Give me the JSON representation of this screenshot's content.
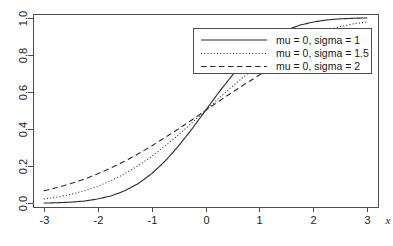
{
  "chart_data": {
    "type": "line",
    "title": "",
    "xlabel": "x",
    "ylabel": "",
    "xlim": [
      -3.2,
      3.2
    ],
    "ylim": [
      -0.02,
      1.02
    ],
    "xticks": [
      "-3",
      "-2",
      "-1",
      "0",
      "1",
      "2",
      "3"
    ],
    "xtick_values": [
      -3,
      -2,
      -1,
      0,
      1,
      2,
      3
    ],
    "yticks": [
      "0.0",
      "0.2",
      "0.4",
      "0.6",
      "0.8",
      "1.0"
    ],
    "ytick_values": [
      0.0,
      0.2,
      0.4,
      0.6,
      0.8,
      1.0
    ],
    "grid": false,
    "legend_position": "top-right",
    "series": [
      {
        "name": "mu = 0, sigma = 1",
        "style": "solid",
        "color": "#2b2b2b",
        "x": [
          -3,
          -2.75,
          -2.5,
          -2.25,
          -2,
          -1.75,
          -1.5,
          -1.25,
          -1,
          -0.75,
          -0.5,
          -0.25,
          0,
          0.25,
          0.5,
          0.75,
          1,
          1.25,
          1.5,
          1.75,
          2,
          2.25,
          2.5,
          2.75,
          3
        ],
        "values": [
          0.001,
          0.003,
          0.006,
          0.012,
          0.023,
          0.04,
          0.067,
          0.106,
          0.159,
          0.227,
          0.309,
          0.401,
          0.5,
          0.599,
          0.691,
          0.773,
          0.841,
          0.894,
          0.933,
          0.96,
          0.977,
          0.988,
          0.994,
          0.997,
          0.999
        ]
      },
      {
        "name": "mu = 0, sigma = 1.5",
        "style": "dotted",
        "color": "#2b2b2b",
        "x": [
          -3,
          -2.75,
          -2.5,
          -2.25,
          -2,
          -1.75,
          -1.5,
          -1.25,
          -1,
          -0.75,
          -0.5,
          -0.25,
          0,
          0.25,
          0.5,
          0.75,
          1,
          1.25,
          1.5,
          1.75,
          2,
          2.25,
          2.5,
          2.75,
          3
        ],
        "values": [
          0.023,
          0.033,
          0.048,
          0.067,
          0.091,
          0.122,
          0.159,
          0.202,
          0.252,
          0.309,
          0.369,
          0.434,
          0.5,
          0.566,
          0.631,
          0.691,
          0.748,
          0.798,
          0.841,
          0.878,
          0.909,
          0.933,
          0.952,
          0.967,
          0.977
        ]
      },
      {
        "name": "mu = 0, sigma = 2",
        "style": "dashed",
        "color": "#2b2b2b",
        "x": [
          -3,
          -2.75,
          -2.5,
          -2.25,
          -2,
          -1.75,
          -1.5,
          -1.25,
          -1,
          -0.75,
          -0.5,
          -0.25,
          0,
          0.25,
          0.5,
          0.75,
          1,
          1.25,
          1.5,
          1.75,
          2,
          2.25,
          2.5,
          2.75,
          3
        ],
        "values": [
          0.067,
          0.085,
          0.106,
          0.13,
          0.159,
          0.191,
          0.227,
          0.266,
          0.309,
          0.354,
          0.401,
          0.45,
          0.5,
          0.55,
          0.599,
          0.646,
          0.691,
          0.734,
          0.773,
          0.809,
          0.841,
          0.87,
          0.894,
          0.915,
          0.933
        ]
      }
    ]
  },
  "legend": {
    "entries": [
      {
        "label": "mu = 0, sigma = 1"
      },
      {
        "label": "mu = 0, sigma = 1.5"
      },
      {
        "label": "mu = 0, sigma = 2"
      }
    ]
  },
  "axes": {
    "x_label": "x"
  }
}
